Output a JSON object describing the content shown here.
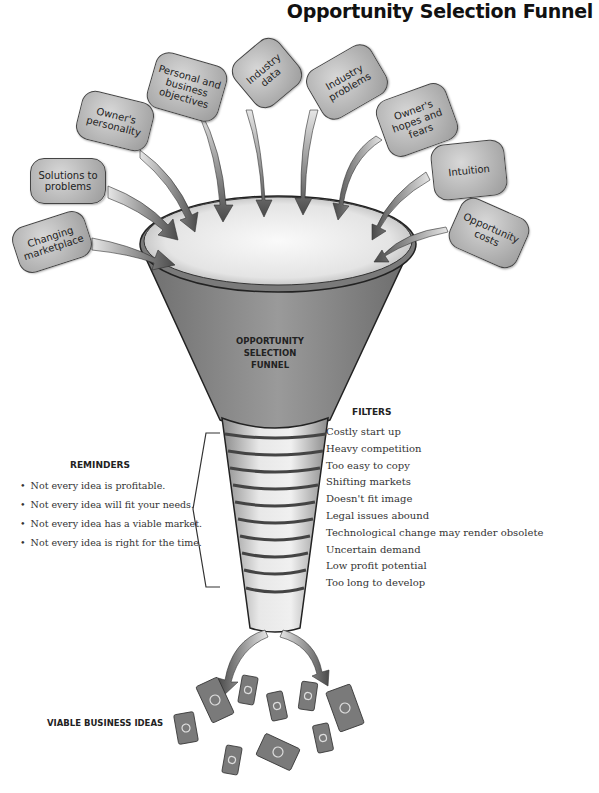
{
  "title": "Opportunity Selection Funnel",
  "inputs": [
    {
      "label": "Changing marketplace"
    },
    {
      "label": "Solutions to problems"
    },
    {
      "label": "Owner's personality"
    },
    {
      "label": "Personal and business objectives"
    },
    {
      "label": "Industry data"
    },
    {
      "label": "Industry problems"
    },
    {
      "label": "Owner's hopes and fears"
    },
    {
      "label": "Intuition"
    },
    {
      "label": "Opportunity costs"
    }
  ],
  "funnel": {
    "label_lines": [
      "OPPORTUNITY",
      "SELECTION",
      "FUNNEL"
    ]
  },
  "filters": {
    "heading": "FILTERS",
    "items": [
      "Costly start up",
      "Heavy competition",
      "Too easy to copy",
      "Shifting markets",
      "Doesn't fit image",
      "Legal issues abound",
      "Technological change may render obsolete",
      "Uncertain demand",
      "Low profit potential",
      "Too long to develop"
    ]
  },
  "reminders": {
    "heading": "REMINDERS",
    "items": [
      "Not every idea is profitable.",
      "Not every idea will fit your needs.",
      "Not every idea has a viable market.",
      "Not every idea is right for the time."
    ]
  },
  "output": {
    "label": "VIABLE BUSINESS IDEAS",
    "icon": "money-bills-icon",
    "bill_count": 10
  },
  "colors": {
    "bubble_fill": "#b5b5b5",
    "funnel_body": "#8a8a8a",
    "funnel_inner": "#eeeeee",
    "arrow_dark": "#555555",
    "bill_fill": "#7a7a7a"
  }
}
